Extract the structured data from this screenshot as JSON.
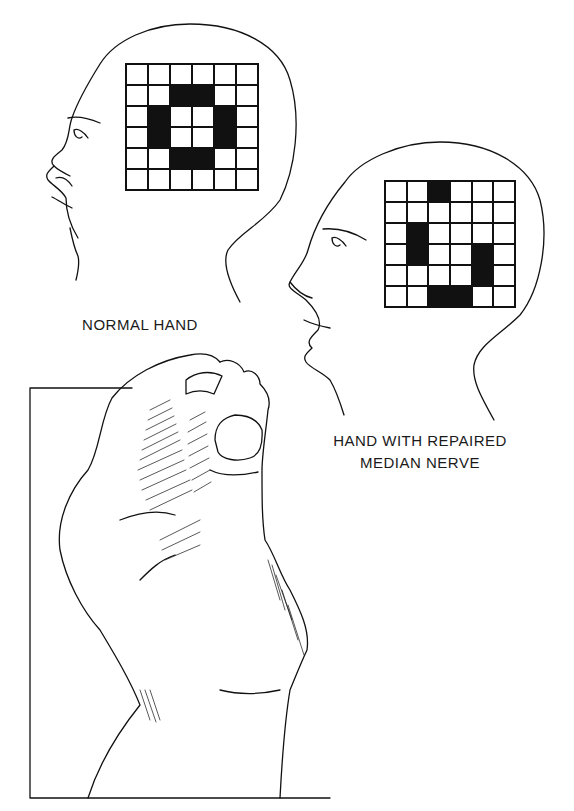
{
  "figure": {
    "panels": [
      {
        "id": "normal",
        "label": "NORMAL HAND",
        "grid": {
          "rows": 6,
          "cols": 6,
          "filled": [
            [
              1,
              2
            ],
            [
              1,
              3
            ],
            [
              2,
              1
            ],
            [
              2,
              4
            ],
            [
              3,
              1
            ],
            [
              3,
              4
            ],
            [
              4,
              2
            ],
            [
              4,
              3
            ]
          ]
        }
      },
      {
        "id": "repaired",
        "label_line1": "HAND WITH REPAIRED",
        "label_line2": "MEDIAN NERVE",
        "grid": {
          "rows": 6,
          "cols": 6,
          "filled": [
            [
              0,
              2
            ],
            [
              2,
              1
            ],
            [
              3,
              1
            ],
            [
              3,
              4
            ],
            [
              4,
              4
            ],
            [
              5,
              2
            ],
            [
              5,
              3
            ]
          ]
        }
      }
    ],
    "illustration": "hand-pinch-grip-holding-object",
    "colors": {
      "ink": "#111111",
      "paper": "#ffffff"
    }
  }
}
